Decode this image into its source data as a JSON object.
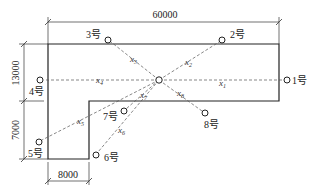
{
  "diagram": {
    "type": "site-plan-measurement-points",
    "dimensions": {
      "top_width": "60000",
      "left_upper_height": "13000",
      "left_lower_height": "7000",
      "bottom_width": "8000"
    },
    "center": {
      "x": 159,
      "y": 80
    },
    "points": [
      {
        "id": "p1",
        "label": "1号",
        "x": 287,
        "y": 80,
        "line": "x",
        "line_sub": "1",
        "lx": 219,
        "ly": 86
      },
      {
        "id": "p2",
        "label": "2号",
        "x": 222,
        "y": 40,
        "line": "x",
        "line_sub": "2",
        "lx": 185,
        "ly": 65
      },
      {
        "id": "p3",
        "label": "3号",
        "x": 108,
        "y": 40,
        "line": "x",
        "line_sub": "3",
        "lx": 130,
        "ly": 62
      },
      {
        "id": "p4",
        "label": "4号",
        "x": 40,
        "y": 80,
        "line": "x",
        "line_sub": "4",
        "lx": 96,
        "ly": 83
      },
      {
        "id": "p5",
        "label": "5号",
        "x": 39,
        "y": 142,
        "line": "x",
        "line_sub": "5",
        "lx": 77,
        "ly": 124
      },
      {
        "id": "p6",
        "label": "6号",
        "x": 96,
        "y": 155,
        "line": "x",
        "line_sub": "6",
        "lx": 118,
        "ly": 133
      },
      {
        "id": "p7",
        "label": "7号",
        "x": 124,
        "y": 111,
        "line": "x",
        "line_sub": "7",
        "lx": 140,
        "ly": 97
      },
      {
        "id": "p8",
        "label": "8号",
        "x": 205,
        "y": 113,
        "line": "x",
        "line_sub": "8",
        "lx": 177,
        "ly": 96
      }
    ],
    "colors": {
      "outline": "#222222",
      "dashed": "#555555",
      "text": "#222222"
    }
  }
}
